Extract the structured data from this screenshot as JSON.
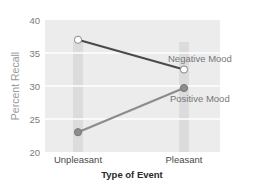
{
  "chart_data": {
    "type": "line",
    "title": "",
    "xlabel": "Type of Event",
    "ylabel": "Percent Recall",
    "categories": [
      "Unpleasant",
      "Pleasant"
    ],
    "ylim": [
      20,
      40
    ],
    "yticks": [
      20,
      25,
      30,
      35,
      40
    ],
    "grid": true,
    "legend_position": "inline-right",
    "series": [
      {
        "name": "Negative Mood",
        "values": [
          37,
          32.5
        ],
        "line_color": "#4a4a4a",
        "marker_fill": "#ffffff",
        "marker_stroke": "#888888"
      },
      {
        "name": "Positive Mood",
        "values": [
          23,
          29.7
        ],
        "line_color": "#8c8c8c",
        "marker_fill": "#8c8c8c",
        "marker_stroke": "#7a7a7a"
      }
    ]
  },
  "colors": {
    "plot_background": "#ececec",
    "gridline": "#ffffff",
    "category_band": "#dcdcdc"
  }
}
